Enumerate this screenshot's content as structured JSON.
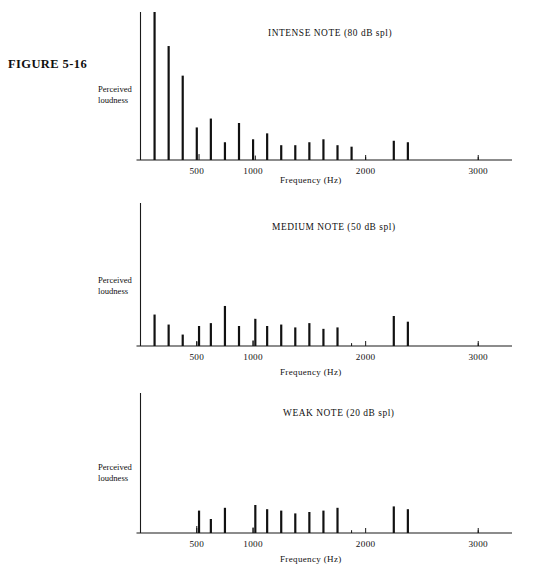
{
  "figure": {
    "number_label": "FIGURE 5-16"
  },
  "axis": {
    "ylabel_line1": "Perceived",
    "ylabel_line2": "loudness",
    "xlabel": "Frequency  (Hz)",
    "tick_labels": [
      "500",
      "1000",
      "2000",
      "3000"
    ],
    "tick_values": [
      500,
      1000,
      2000,
      3000
    ],
    "xmin": 0,
    "xmax": 3300,
    "color_axis": "#1a1a1a",
    "color_stem": "#111111"
  },
  "panels": [
    {
      "key": "intense",
      "title": "INTENSE NOTE  (80 dB spl)",
      "title_left": 268,
      "chart_data": {
        "type": "bar",
        "title": "INTENSE NOTE  (80 dB spl)",
        "xlabel": "Frequency  (Hz)",
        "ylabel": "Perceived loudness",
        "xlim": [
          0,
          3300
        ],
        "ylim": [
          0,
          100
        ],
        "grid": false,
        "legend": "none",
        "x": [
          125,
          250,
          375,
          500,
          520,
          625,
          750,
          875,
          1000,
          1020,
          1125,
          1250,
          1375,
          1500,
          1625,
          1750,
          1875,
          2000,
          2250,
          2375,
          3000
        ],
        "values": [
          100,
          77,
          57,
          22,
          4,
          28,
          12,
          25,
          14,
          3,
          18,
          10,
          10,
          12,
          14,
          10,
          9,
          2,
          13,
          12,
          2
        ]
      }
    },
    {
      "key": "medium",
      "title": "MEDIUM NOTE  (50 dB spl)",
      "title_left": 272,
      "chart_data": {
        "type": "bar",
        "title": "MEDIUM NOTE  (50 dB spl)",
        "xlabel": "Frequency  (Hz)",
        "ylabel": "Perceived loudness",
        "xlim": [
          0,
          3300
        ],
        "ylim": [
          0,
          100
        ],
        "grid": false,
        "legend": "none",
        "x": [
          125,
          250,
          375,
          500,
          520,
          625,
          750,
          875,
          1000,
          1020,
          1125,
          1250,
          1375,
          1500,
          1625,
          1750,
          1875,
          2000,
          2250,
          2375,
          3000
        ],
        "values": [
          22,
          15,
          8,
          3,
          14,
          16,
          28,
          14,
          4,
          19,
          14,
          15,
          13,
          16,
          12,
          13,
          2,
          0,
          21,
          17,
          2
        ]
      }
    },
    {
      "key": "weak",
      "title": "WEAK NOTE  (20 dB spl)",
      "title_left": 283,
      "chart_data": {
        "type": "bar",
        "title": "WEAK NOTE  (20 dB spl)",
        "xlabel": "Frequency  (Hz)",
        "ylabel": "Perceived loudness",
        "xlim": [
          0,
          3300
        ],
        "ylim": [
          0,
          100
        ],
        "grid": false,
        "legend": "none",
        "x": [
          500,
          520,
          625,
          750,
          1000,
          1020,
          1125,
          1250,
          1375,
          1500,
          1625,
          1750,
          1875,
          2000,
          2250,
          2375,
          3000
        ],
        "values": [
          5,
          16,
          10,
          18,
          4,
          20,
          17,
          16,
          14,
          15,
          16,
          18,
          2,
          0,
          19,
          17,
          2
        ]
      }
    }
  ]
}
